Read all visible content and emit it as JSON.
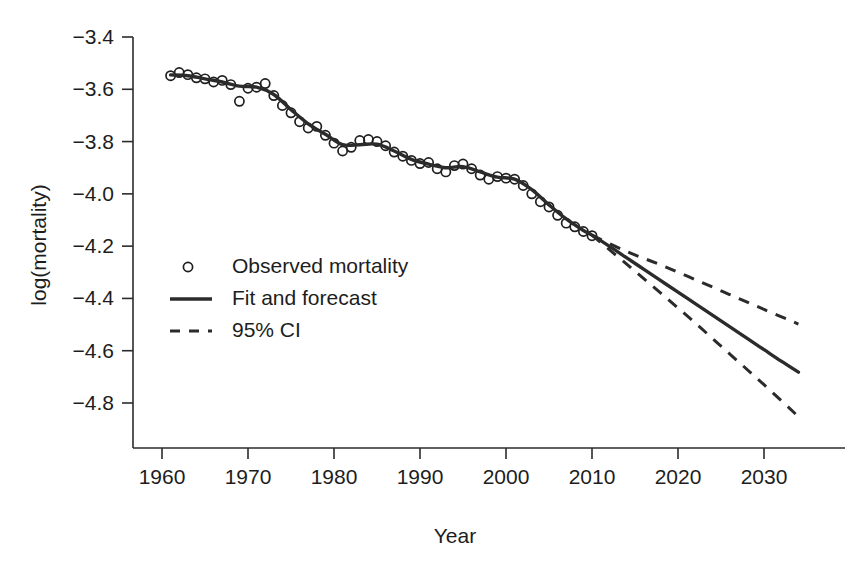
{
  "chart_data": {
    "type": "line",
    "title": "",
    "xlabel": "Year",
    "ylabel": "log(mortality)",
    "xlim": [
      1958.5,
      2036
    ],
    "ylim": [
      -4.92,
      -3.34
    ],
    "grid": false,
    "legend_position": "center-left",
    "x_ticks": [
      1960,
      1970,
      1980,
      1990,
      2000,
      2010,
      2020,
      2030
    ],
    "x_tick_labels": [
      "1960",
      "1970",
      "1980",
      "1990",
      "2000",
      "2010",
      "2020",
      "2030"
    ],
    "y_ticks": [
      -3.4,
      -3.6,
      -3.8,
      -4.0,
      -4.2,
      -4.4,
      -4.6,
      -4.8
    ],
    "y_tick_labels": [
      "−3.4",
      "−3.6",
      "−3.8",
      "−4.0",
      "−4.2",
      "−4.4",
      "−4.6",
      "−4.8"
    ],
    "legend": [
      {
        "label": "Observed mortality",
        "marker": "circle",
        "style": "open-circle"
      },
      {
        "label": "Fit and forecast",
        "marker": "line",
        "style": "solid"
      },
      {
        "label": "95% CI",
        "marker": "line",
        "style": "dashed"
      }
    ],
    "series": [
      {
        "name": "Observed mortality",
        "type": "scatter",
        "marker": "open-circle",
        "color": "#1f1f1f",
        "x": [
          1961,
          1962,
          1963,
          1964,
          1965,
          1966,
          1967,
          1968,
          1969,
          1970,
          1971,
          1972,
          1973,
          1974,
          1975,
          1976,
          1977,
          1978,
          1979,
          1980,
          1981,
          1982,
          1983,
          1984,
          1985,
          1986,
          1987,
          1988,
          1989,
          1990,
          1991,
          1992,
          1993,
          1994,
          1995,
          1996,
          1997,
          1998,
          1999,
          2000,
          2001,
          2002,
          2003,
          2004,
          2005,
          2006,
          2007,
          2008,
          2009,
          2010
        ],
        "y": [
          -3.548,
          -3.536,
          -3.544,
          -3.556,
          -3.56,
          -3.572,
          -3.566,
          -3.582,
          -3.646,
          -3.596,
          -3.592,
          -3.578,
          -3.624,
          -3.662,
          -3.69,
          -3.724,
          -3.748,
          -3.742,
          -3.776,
          -3.806,
          -3.836,
          -3.822,
          -3.796,
          -3.792,
          -3.8,
          -3.816,
          -3.84,
          -3.856,
          -3.872,
          -3.884,
          -3.88,
          -3.904,
          -3.916,
          -3.892,
          -3.886,
          -3.904,
          -3.928,
          -3.944,
          -3.934,
          -3.94,
          -3.944,
          -3.968,
          -4.0,
          -4.03,
          -4.05,
          -4.082,
          -4.112,
          -4.126,
          -4.144,
          -4.16
        ]
      },
      {
        "name": "Fit and forecast",
        "type": "line",
        "style": "solid",
        "color": "#2b2b2b",
        "x": [
          1961,
          1963,
          1965,
          1967,
          1969,
          1971,
          1973,
          1975,
          1977,
          1979,
          1981,
          1983,
          1985,
          1987,
          1989,
          1991,
          1993,
          1995,
          1997,
          1999,
          2001,
          2003,
          2005,
          2007,
          2009,
          2010,
          2012,
          2014,
          2016,
          2018,
          2020,
          2022,
          2024,
          2026,
          2028,
          2030,
          2032,
          2034
        ],
        "y": [
          -3.545,
          -3.548,
          -3.56,
          -3.572,
          -3.588,
          -3.592,
          -3.62,
          -3.678,
          -3.732,
          -3.772,
          -3.812,
          -3.812,
          -3.81,
          -3.836,
          -3.868,
          -3.886,
          -3.9,
          -3.896,
          -3.916,
          -3.936,
          -3.944,
          -3.984,
          -4.042,
          -4.096,
          -4.14,
          -4.158,
          -4.2,
          -4.244,
          -4.288,
          -4.332,
          -4.376,
          -4.42,
          -4.464,
          -4.508,
          -4.552,
          -4.596,
          -4.64,
          -4.682
        ]
      },
      {
        "name": "95% CI upper",
        "type": "line",
        "style": "dashed",
        "color": "#2b2b2b",
        "x": [
          2010,
          2014,
          2018,
          2022,
          2026,
          2030,
          2034
        ],
        "y": [
          -4.158,
          -4.22,
          -4.272,
          -4.328,
          -4.385,
          -4.442,
          -4.498
        ]
      },
      {
        "name": "95% CI lower",
        "type": "line",
        "style": "dashed",
        "color": "#2b2b2b",
        "x": [
          2010,
          2014,
          2018,
          2022,
          2026,
          2030,
          2034
        ],
        "y": [
          -4.158,
          -4.268,
          -4.38,
          -4.494,
          -4.612,
          -4.73,
          -4.852
        ]
      }
    ]
  },
  "axis": {
    "x_title": "Year",
    "y_title": "log(mortality)"
  }
}
